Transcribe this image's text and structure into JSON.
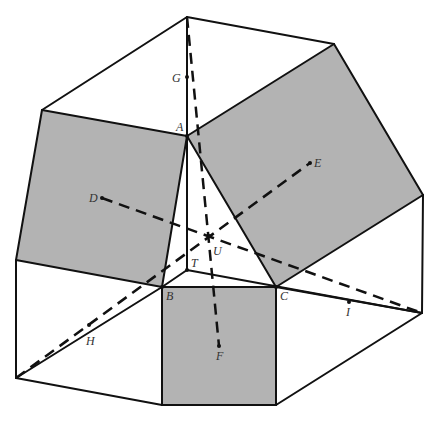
{
  "figure": {
    "width": 438,
    "height": 422,
    "colors": {
      "background": "#ffffff",
      "shaded": "#b3b3b3",
      "line": "#111111",
      "label": "#333333"
    },
    "shaded_polygons": [
      {
        "name": "left-square",
        "points": [
          [
            42,
            110
          ],
          [
            187,
            136
          ],
          [
            162,
            287
          ],
          [
            16,
            260
          ]
        ]
      },
      {
        "name": "right-square",
        "points": [
          [
            187,
            136
          ],
          [
            334,
            44
          ],
          [
            423,
            195
          ],
          [
            276,
            287
          ]
        ]
      },
      {
        "name": "bottom-square",
        "points": [
          [
            162,
            287
          ],
          [
            276,
            287
          ],
          [
            276,
            405
          ],
          [
            162,
            405
          ]
        ]
      }
    ],
    "solid_segments": [
      [
        [
          42,
          110
        ],
        [
          187,
          17
        ]
      ],
      [
        [
          187,
          17
        ],
        [
          334,
          44
        ]
      ],
      [
        [
          187,
          17
        ],
        [
          187,
          136
        ]
      ],
      [
        [
          42,
          110
        ],
        [
          187,
          136
        ]
      ],
      [
        [
          187,
          136
        ],
        [
          334,
          44
        ]
      ],
      [
        [
          334,
          44
        ],
        [
          423,
          195
        ]
      ],
      [
        [
          42,
          110
        ],
        [
          16,
          260
        ]
      ],
      [
        [
          187,
          136
        ],
        [
          162,
          287
        ]
      ],
      [
        [
          187,
          136
        ],
        [
          276,
          287
        ]
      ],
      [
        [
          16,
          260
        ],
        [
          162,
          287
        ]
      ],
      [
        [
          276,
          287
        ],
        [
          423,
          195
        ]
      ],
      [
        [
          162,
          287
        ],
        [
          276,
          287
        ]
      ],
      [
        [
          187,
          136
        ],
        [
          187,
          270
        ]
      ],
      [
        [
          187,
          270
        ],
        [
          162,
          287
        ]
      ],
      [
        [
          187,
          270
        ],
        [
          422,
          313
        ]
      ],
      [
        [
          16,
          260
        ],
        [
          16,
          378
        ]
      ],
      [
        [
          423,
          195
        ],
        [
          422,
          313
        ]
      ],
      [
        [
          162,
          287
        ],
        [
          162,
          405
        ]
      ],
      [
        [
          276,
          287
        ],
        [
          276,
          405
        ]
      ],
      [
        [
          16,
          378
        ],
        [
          162,
          405
        ]
      ],
      [
        [
          162,
          405
        ],
        [
          276,
          405
        ]
      ],
      [
        [
          276,
          405
        ],
        [
          422,
          313
        ]
      ],
      [
        [
          16,
          378
        ],
        [
          162,
          287
        ]
      ],
      [
        [
          276,
          287
        ],
        [
          422,
          313
        ]
      ]
    ],
    "dashed_segments": [
      [
        [
          187,
          17
        ],
        [
          219,
          346
        ]
      ],
      [
        [
          102,
          198
        ],
        [
          422,
          313
        ]
      ],
      [
        [
          16,
          378
        ],
        [
          310,
          163
        ]
      ]
    ],
    "points": [
      {
        "id": "G",
        "x": 187,
        "y": 77,
        "lx": 172,
        "ly": 82
      },
      {
        "id": "A",
        "x": 187,
        "y": 136,
        "lx": 176,
        "ly": 131
      },
      {
        "id": "D",
        "x": 102,
        "y": 198,
        "lx": 89,
        "ly": 202
      },
      {
        "id": "E",
        "x": 310,
        "y": 163,
        "lx": 314,
        "ly": 167
      },
      {
        "id": "U",
        "x": 209,
        "y": 236,
        "lx": 213,
        "ly": 255
      },
      {
        "id": "T",
        "x": 187,
        "y": 270,
        "lx": 191,
        "ly": 267
      },
      {
        "id": "B",
        "x": 162,
        "y": 287,
        "lx": 166,
        "ly": 300
      },
      {
        "id": "C",
        "x": 276,
        "y": 287,
        "lx": 280,
        "ly": 300
      },
      {
        "id": "I",
        "x": 349,
        "y": 302,
        "lx": 346,
        "ly": 316
      },
      {
        "id": "H",
        "x": 89,
        "y": 325,
        "lx": 86,
        "ly": 345
      },
      {
        "id": "F",
        "x": 219,
        "y": 346,
        "lx": 216,
        "ly": 360
      }
    ],
    "labels": {
      "G": "G",
      "A": "A",
      "D": "D",
      "E": "E",
      "U": "U",
      "T": "T",
      "B": "B",
      "C": "C",
      "I": "I",
      "H": "H",
      "F": "F"
    }
  }
}
